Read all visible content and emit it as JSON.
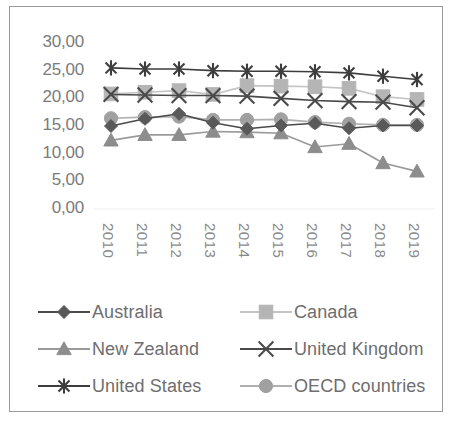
{
  "chart_data": {
    "type": "line",
    "title": "",
    "subtitle": "",
    "xlabel": "",
    "ylabel": "",
    "categories": [
      "2010",
      "2011",
      "2012",
      "2013",
      "2014",
      "2015",
      "2016",
      "2017",
      "2018",
      "2019"
    ],
    "x": [
      2010,
      2011,
      2012,
      2013,
      2014,
      2015,
      2016,
      2017,
      2018,
      2019
    ],
    "ylim": [
      0,
      30
    ],
    "ytick_values": [
      0,
      5,
      10,
      15,
      20,
      25,
      30
    ],
    "ytick_labels": [
      "0,00",
      "5,00",
      "10,00",
      "15,00",
      "20,00",
      "25,00",
      "30,00"
    ],
    "grid": false,
    "legend_position": "bottom",
    "decimal_separator": ",",
    "series": [
      {
        "name": "Australia",
        "marker": "diamond",
        "color": "#595959",
        "line_color": "#4a4a4a",
        "values": [
          15.0,
          16.3,
          17.2,
          15.6,
          14.5,
          15.1,
          15.5,
          14.6,
          15.1,
          15.1
        ]
      },
      {
        "name": "Canada",
        "marker": "square",
        "color": "#b5b5b5",
        "line_color": "#c4c4c4",
        "values": [
          20.8,
          21.1,
          21.4,
          20.7,
          22.3,
          22.2,
          22.1,
          21.8,
          20.3,
          19.8
        ]
      },
      {
        "name": "New Zealand",
        "marker": "triangle",
        "color": "#8d8d8d",
        "line_color": "#9a9a9a",
        "values": [
          12.4,
          13.4,
          13.4,
          14.0,
          13.9,
          13.7,
          11.2,
          11.8,
          8.3,
          6.8
        ]
      },
      {
        "name": "United Kingdom",
        "marker": "cross",
        "color": "#4a4a4a",
        "line_color": "#4a4a4a",
        "values": [
          20.7,
          20.6,
          20.5,
          20.5,
          20.4,
          20.0,
          19.6,
          19.4,
          19.3,
          18.3
        ]
      },
      {
        "name": "United States",
        "marker": "asterisk",
        "color": "#3d3d3d",
        "line_color": "#3d3d3d",
        "values": [
          25.5,
          25.3,
          25.3,
          25.0,
          24.9,
          24.9,
          24.8,
          24.6,
          24.0,
          23.4
        ]
      },
      {
        "name": "OECD countries",
        "marker": "circle",
        "color": "#a0a0a0",
        "line_color": "#b0b0b0",
        "values": [
          16.4,
          16.6,
          16.7,
          16.1,
          16.1,
          16.2,
          15.7,
          15.4,
          15.2,
          15.2
        ]
      }
    ]
  },
  "legend": {
    "rows": [
      [
        {
          "label": "Australia",
          "series_index": 0
        },
        {
          "label": "Canada",
          "series_index": 1
        }
      ],
      [
        {
          "label": "New Zealand",
          "series_index": 2
        },
        {
          "label": "United Kingdom",
          "series_index": 3
        }
      ],
      [
        {
          "label": "United States",
          "series_index": 4
        },
        {
          "label": "OECD countries",
          "series_index": 5
        }
      ]
    ]
  }
}
